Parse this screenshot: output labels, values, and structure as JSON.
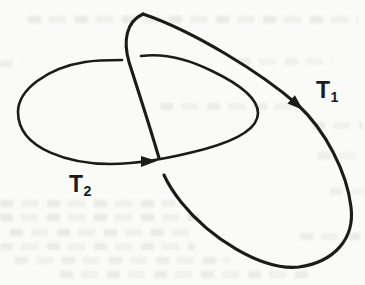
{
  "figure": {
    "loops": [
      {
        "id": "T1",
        "label_base": "T",
        "label_sub": "1",
        "arrow_icon": "arrow-down-right-icon",
        "arrow_direction": "down-right"
      },
      {
        "id": "T2",
        "label_base": "T",
        "label_sub": "2",
        "arrow_icon": "arrow-right-icon",
        "arrow_direction": "right"
      }
    ],
    "colors": {
      "stroke": "#1b1b1b",
      "background": "#fafaf8",
      "smudge": "#c9c9c3"
    }
  }
}
